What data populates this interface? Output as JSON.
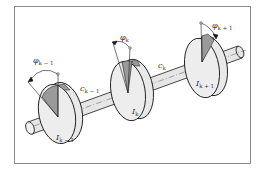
{
  "diagram": {
    "type": "torsional-vibration-shaft-with-disks",
    "colors": {
      "frame": "#8a8a8a",
      "shaft_fill": "#e6e6e6",
      "disk_fill": "#e9e9e9",
      "sector_fill": "#9a9a9a",
      "outline": "#1a1a1a"
    },
    "disks": [
      {
        "inertia_label": "I",
        "inertia_sub": "k − 1",
        "angle_label": "φ",
        "angle_sub": "k − 1"
      },
      {
        "inertia_label": "I",
        "inertia_sub": "k",
        "angle_label": "φ",
        "angle_sub": "k"
      },
      {
        "inertia_label": "I",
        "inertia_sub": "k + 1",
        "angle_label": "φ",
        "angle_sub": "k + 1"
      }
    ],
    "springs": [
      {
        "label": "c",
        "sub": "k − 1"
      },
      {
        "label": "c",
        "sub": "k"
      }
    ]
  }
}
